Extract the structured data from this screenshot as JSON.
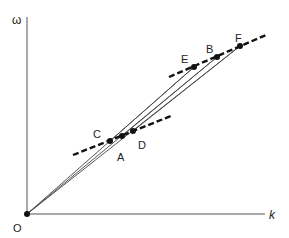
{
  "diagram": {
    "axes": {
      "y_label": "ω",
      "x_label": "k",
      "origin_label": "O",
      "origin": [
        27,
        214
      ],
      "y_top": [
        27,
        17
      ],
      "x_end": [
        265,
        214
      ]
    },
    "points": [
      {
        "id": "O",
        "label": "O",
        "xy": [
          27,
          214
        ],
        "label_xy": [
          13,
          232
        ]
      },
      {
        "id": "C",
        "label": "C",
        "xy": [
          110,
          141
        ],
        "label_xy": [
          93,
          138
        ]
      },
      {
        "id": "A",
        "label": "A",
        "xy": [
          122,
          136
        ],
        "label_xy": [
          117,
          161
        ]
      },
      {
        "id": "D",
        "label": "D",
        "xy": [
          133,
          131
        ],
        "label_xy": [
          138,
          149
        ]
      },
      {
        "id": "E",
        "label": "E",
        "xy": [
          194,
          67
        ],
        "label_xy": [
          181,
          63
        ]
      },
      {
        "id": "B",
        "label": "B",
        "xy": [
          217,
          57
        ],
        "label_xy": [
          206,
          53
        ]
      },
      {
        "id": "F",
        "label": "F",
        "xy": [
          240,
          46
        ],
        "label_xy": [
          235,
          42
        ]
      }
    ],
    "dashed_lines": [
      {
        "name": "upper-tangent",
        "from": [
          169,
          77
        ],
        "to": [
          266,
          35
        ]
      },
      {
        "name": "lower-tangent",
        "from": [
          73,
          155
        ],
        "to": [
          171,
          116
        ]
      }
    ],
    "chords": [
      {
        "name": "chord-C-E",
        "from": "C",
        "to": "E"
      },
      {
        "name": "chord-A-B",
        "from": "A",
        "to": "B"
      },
      {
        "name": "chord-D-F",
        "from": "D",
        "to": "F"
      },
      {
        "name": "ray-O-E",
        "from": "O",
        "to": "E"
      },
      {
        "name": "ray-O-B",
        "from": "O",
        "to": "B"
      },
      {
        "name": "ray-O-F",
        "from": "O",
        "to": "F"
      }
    ],
    "colors": {
      "axis": "#555555",
      "line": "#444444",
      "dash": "#111111",
      "point": "#111111"
    }
  }
}
